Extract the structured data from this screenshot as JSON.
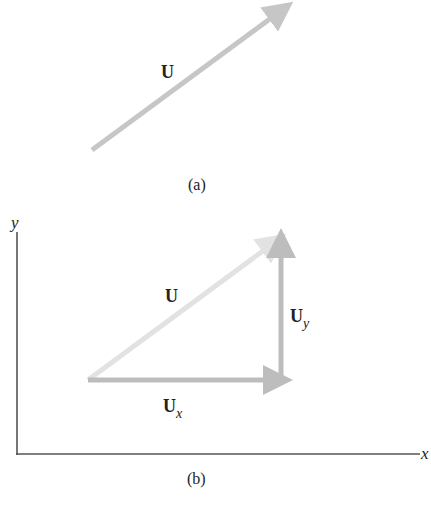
{
  "figure": {
    "panel_a": {
      "caption": "(a)",
      "vector": {
        "label": "U",
        "start": [
          92,
          150
        ],
        "end": [
          288,
          5
        ],
        "color": "#c6c6c6"
      }
    },
    "panel_b": {
      "caption": "(b)",
      "axes": {
        "x_label": "x",
        "y_label": "y",
        "origin": [
          17,
          454
        ],
        "x_end": 420,
        "y_top": 232,
        "color": "#555555"
      },
      "vector_U": {
        "label": "U",
        "start": [
          88,
          380
        ],
        "end": [
          280,
          238
        ],
        "color": "#e2e2e2"
      },
      "component_x": {
        "label": "U",
        "subscript": "x",
        "start": [
          88,
          380
        ],
        "end": [
          285,
          380
        ],
        "color": "#bdbdbd"
      },
      "component_y": {
        "label": "U",
        "subscript": "y",
        "start": [
          281,
          380
        ],
        "end": [
          281,
          236
        ],
        "color": "#bdbdbd"
      }
    }
  }
}
